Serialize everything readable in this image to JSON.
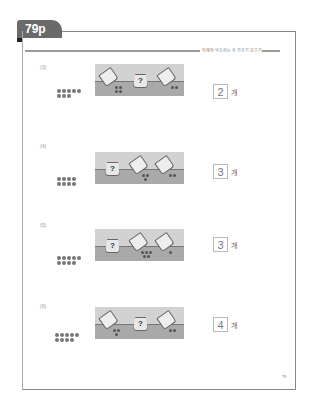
{
  "tab": {
    "label": "79p"
  },
  "header": {
    "text": "차례와 약속하는 수 가르기 모으기"
  },
  "questions": [
    {
      "num": "(3)",
      "dots": 8,
      "question_mark": "?",
      "answer": "2",
      "unit": "개"
    },
    {
      "num": "(4)",
      "dots": 8,
      "question_mark": "?",
      "answer": "3",
      "unit": "개"
    },
    {
      "num": "(5)",
      "dots": 9,
      "question_mark": "?",
      "answer": "3",
      "unit": "개"
    },
    {
      "num": "(6)",
      "dots": 9,
      "question_mark": "?",
      "answer": "4",
      "unit": "개"
    }
  ],
  "page_number": "79",
  "colors": {
    "tab": "#6a6a6a",
    "panel_sky": "#d2d2d2",
    "panel_ground": "#a9a9a9"
  }
}
